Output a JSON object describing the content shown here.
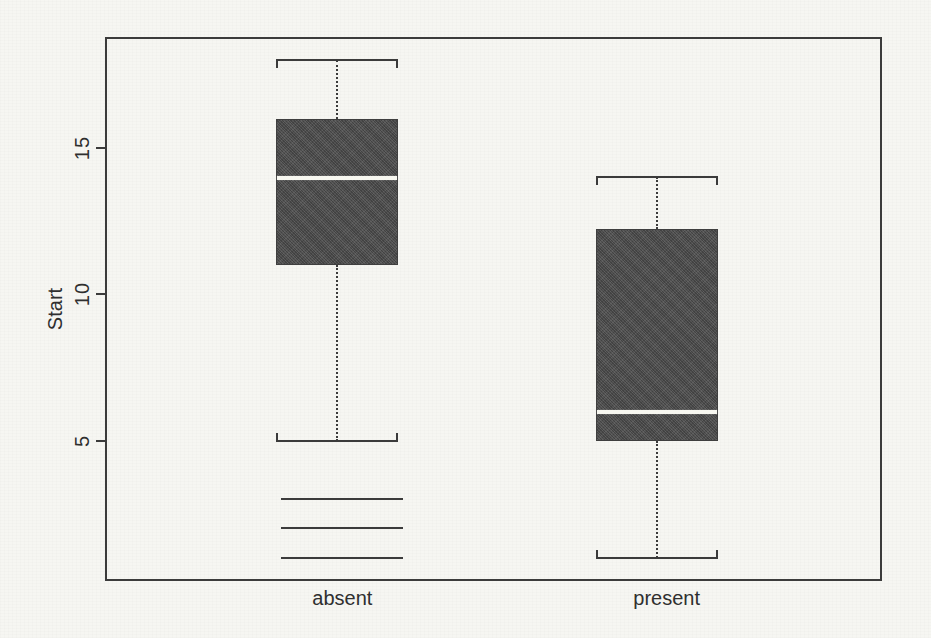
{
  "figure": {
    "ylabel": "Start"
  },
  "chart_data": {
    "type": "boxplot",
    "title": "",
    "xlabel": "",
    "ylabel": "Start",
    "categories": [
      "absent",
      "present"
    ],
    "yticks": [
      5,
      10,
      15
    ],
    "ylim": [
      0.2,
      18.8
    ],
    "grid": false,
    "legend": "none",
    "series": [
      {
        "name": "absent",
        "whisker_low": 5,
        "q1": 11,
        "median": 14,
        "q3": 16,
        "whisker_high": 18,
        "outliers": [
          1,
          2,
          3
        ],
        "outlier_marker": "horizontal-dash"
      },
      {
        "name": "present",
        "whisker_low": 1,
        "q1": 5,
        "median": 6,
        "q3": 12.25,
        "whisker_high": 14,
        "outliers": [],
        "outlier_marker": "horizontal-dash"
      }
    ],
    "colors": {
      "box_fill": "#4e4e4e",
      "median_line": "#f7f7f0",
      "line": "#3b3b3b",
      "background": "#f6f6f2",
      "text": "#2f2f2f"
    }
  }
}
